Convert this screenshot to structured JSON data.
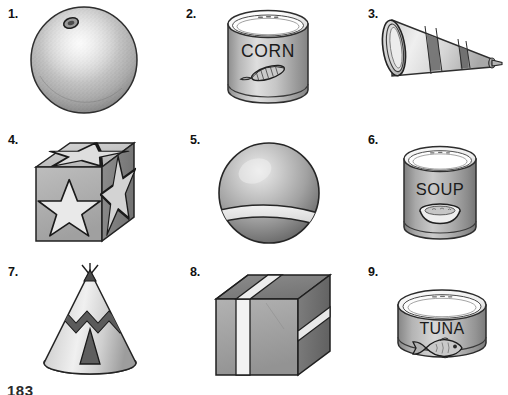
{
  "page": {
    "page_number": "183",
    "background_color": "#ffffff",
    "ink_color": "#1a1a1a"
  },
  "items": [
    {
      "number": "1.",
      "name": "orange",
      "shape": "sphere",
      "description": "A textured orange fruit with a small stem nub at the upper left",
      "label_text": "",
      "colors": {
        "fill": "#b9b9b9",
        "shade": "#8f8f8f",
        "highlight": "#dcdcdc",
        "outline": "#2e2e2e"
      }
    },
    {
      "number": "2.",
      "name": "corn-can",
      "shape": "cylinder",
      "description": "A cylindrical food can labeled CORN with an ear of corn picture",
      "label_text": "CORN",
      "colors": {
        "fill": "#c2c2c2",
        "shade": "#949494",
        "highlight": "#e8e8e8",
        "outline": "#2e2e2e"
      }
    },
    {
      "number": "3.",
      "name": "megaphone",
      "shape": "cone",
      "description": "A megaphone cone lying sideways with two diagonal dark stripes",
      "label_text": "",
      "colors": {
        "fill": "#cfcfcf",
        "shade": "#8a8a8a",
        "highlight": "#f0f0f0",
        "outline": "#2e2e2e"
      }
    },
    {
      "number": "4.",
      "name": "star-block",
      "shape": "cube",
      "description": "A cube block with a large five-pointed star on each visible face",
      "label_text": "",
      "colors": {
        "fill": "#b5b5b5",
        "shade": "#8c8c8c",
        "highlight": "#e4e4e4",
        "outline": "#222222"
      }
    },
    {
      "number": "5.",
      "name": "ball",
      "shape": "sphere",
      "description": "A round ball with a light horizontal band around its lower middle",
      "label_text": "",
      "colors": {
        "fill": "#a9a9a9",
        "shade": "#7c7c7c",
        "highlight": "#e0e0e0",
        "outline": "#262626"
      }
    },
    {
      "number": "6.",
      "name": "soup-can",
      "shape": "cylinder",
      "description": "A cylindrical food can labeled SOUP with a bowl of soup picture",
      "label_text": "SOUP",
      "colors": {
        "fill": "#a8a8a8",
        "shade": "#7e7e7e",
        "highlight": "#ededed",
        "outline": "#2e2e2e"
      }
    },
    {
      "number": "7.",
      "name": "teepee",
      "shape": "cone",
      "description": "A cone shaped teepee with a zigzag band and a dark triangular door",
      "label_text": "",
      "colors": {
        "fill": "#c8c8c8",
        "shade": "#9a9a9a",
        "highlight": "#efefef",
        "outline": "#242424"
      }
    },
    {
      "number": "8.",
      "name": "wrapped-box",
      "shape": "cube",
      "description": "A boxed package wrapped with a light vertical ribbon strip",
      "label_text": "",
      "colors": {
        "fill": "#9e9e9e",
        "shade": "#787878",
        "highlight": "#efefef",
        "outline": "#1f1f1f"
      }
    },
    {
      "number": "9.",
      "name": "tuna-can",
      "shape": "cylinder",
      "description": "A short wide can labeled TUNA with a fish picture",
      "label_text": "TUNA",
      "colors": {
        "fill": "#b5b5b5",
        "shade": "#8b8b8b",
        "highlight": "#ebebeb",
        "outline": "#2b2b2b"
      }
    }
  ]
}
